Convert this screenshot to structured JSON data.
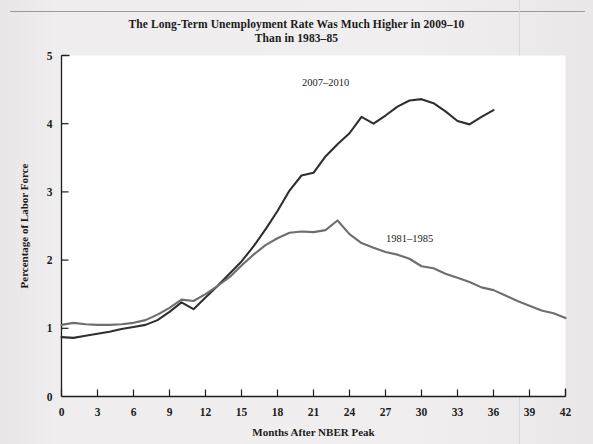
{
  "figure": {
    "title_line1": "The Long-Term Unemployment Rate Was Much Higher in 2009–10",
    "title_line2": "Than in 1983–85",
    "background_color": "#edebeb"
  },
  "chart_data": {
    "type": "line",
    "title": "The Long-Term Unemployment Rate Was Much Higher in 2009–10 Than in 1983–85",
    "xlabel": "Months After NBER Peak",
    "ylabel": "Percentage of Labor Force",
    "xlim": [
      0,
      42
    ],
    "ylim": [
      0,
      5
    ],
    "xticks": [
      0,
      3,
      6,
      9,
      12,
      15,
      18,
      21,
      24,
      27,
      30,
      33,
      36,
      39,
      42
    ],
    "yticks": [
      0,
      1,
      2,
      3,
      4,
      5
    ],
    "xtick_labels": [
      "0",
      "3",
      "6",
      "9",
      "12",
      "15",
      "18",
      "21",
      "24",
      "27",
      "30",
      "33",
      "36",
      "39",
      "42"
    ],
    "ytick_labels": [
      "0",
      "1",
      "2",
      "3",
      "4",
      "5"
    ],
    "grid": false,
    "legend": "inline-annotations",
    "series": [
      {
        "name": "2007–2010",
        "color": "#2f2f2f",
        "label_x": 22,
        "label_y": 4.55,
        "x": [
          0,
          1,
          2,
          3,
          4,
          5,
          6,
          7,
          8,
          9,
          10,
          11,
          12,
          13,
          14,
          15,
          16,
          17,
          18,
          19,
          20,
          21,
          22,
          23,
          24,
          25,
          26,
          27,
          28,
          29,
          30,
          31,
          32,
          33,
          34,
          35,
          36
        ],
        "values": [
          0.87,
          0.86,
          0.89,
          0.92,
          0.95,
          0.99,
          1.02,
          1.05,
          1.12,
          1.24,
          1.38,
          1.28,
          1.45,
          1.62,
          1.8,
          1.98,
          2.2,
          2.45,
          2.72,
          3.02,
          3.24,
          3.28,
          3.52,
          3.7,
          3.86,
          4.1,
          4.0,
          4.12,
          4.25,
          4.34,
          4.36,
          4.3,
          4.18,
          4.04,
          3.99,
          4.1,
          4.2
        ]
      },
      {
        "name": "1981–1985",
        "color": "#6e6e6e",
        "label_x": 29,
        "label_y": 2.26,
        "x": [
          0,
          1,
          2,
          3,
          4,
          5,
          6,
          7,
          8,
          9,
          10,
          11,
          12,
          13,
          14,
          15,
          16,
          17,
          18,
          19,
          20,
          21,
          22,
          23,
          24,
          25,
          26,
          27,
          28,
          29,
          30,
          31,
          32,
          33,
          34,
          35,
          36,
          37,
          38,
          39,
          40,
          41,
          42
        ],
        "values": [
          1.05,
          1.08,
          1.06,
          1.05,
          1.05,
          1.06,
          1.08,
          1.12,
          1.2,
          1.3,
          1.42,
          1.4,
          1.5,
          1.62,
          1.75,
          1.92,
          2.08,
          2.22,
          2.32,
          2.4,
          2.42,
          2.41,
          2.44,
          2.58,
          2.38,
          2.25,
          2.18,
          2.12,
          2.08,
          2.02,
          1.91,
          1.88,
          1.8,
          1.74,
          1.68,
          1.6,
          1.56,
          1.48,
          1.4,
          1.33,
          1.26,
          1.22,
          1.15
        ]
      }
    ]
  }
}
